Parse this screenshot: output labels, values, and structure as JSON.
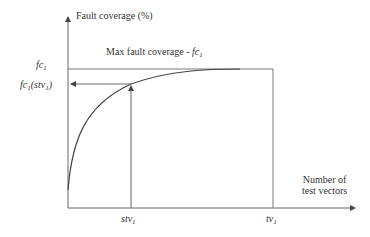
{
  "diagram": {
    "y_axis_label": "Fault coverage (%)",
    "x_axis_label_line1": "Number of",
    "x_axis_label_line2": "test vectors",
    "max_label_prefix": "Max fault coverage - ",
    "max_label_symbol": "fc",
    "max_label_sub": "1",
    "y_tick_fc1": {
      "symbol": "fc",
      "sub": "1"
    },
    "y_tick_fc1_stv1": {
      "symbol": "fc",
      "sub": "1",
      "suffix_open": "(stv",
      "suffix_sub": "1",
      "suffix_close": ")"
    },
    "x_tick_stv1": {
      "symbol": "stv",
      "sub": "1"
    },
    "x_tick_tv1": {
      "symbol": "tv",
      "sub": "1"
    },
    "colors": {
      "line": "#555555",
      "text": "#333333",
      "background": "#ffffff"
    }
  }
}
